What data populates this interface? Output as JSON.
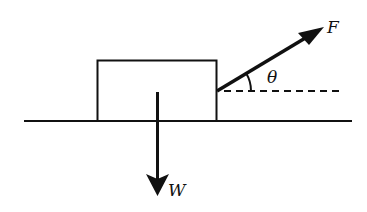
{
  "diagram": {
    "type": "free-body diagram",
    "labels": {
      "force": "F",
      "weight": "W",
      "angle": "θ"
    },
    "colors": {
      "stroke": "#111111",
      "background": "#ffffff"
    }
  }
}
